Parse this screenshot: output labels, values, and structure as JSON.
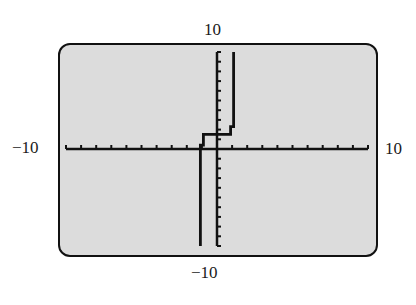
{
  "window": {
    "xmin": "−10",
    "xmax": "10",
    "ymin": "−10",
    "ymax": "10"
  },
  "chart_data": {
    "type": "line",
    "title": "",
    "xlabel": "",
    "ylabel": "",
    "xlim": [
      -10,
      10
    ],
    "ylim": [
      -10,
      10
    ],
    "xscale": 1,
    "yscale": 1,
    "grid": false,
    "legend": null,
    "tick_labels": {
      "x_left": "−10",
      "x_right": "10",
      "y_top": "10",
      "y_bottom": "−10"
    },
    "series": [
      {
        "name": "step curve",
        "description": "Piecewise step-like graph: vertical near x=-1 from y=-10 up to y~0.5, step right to x~-0.8, up to y~1.5, horizontal to x~1, up to y~2.5, then vertical near x=1 up to y=10",
        "points": [
          [
            -1.1,
            -10
          ],
          [
            -1.1,
            0.4
          ],
          [
            -0.9,
            0.4
          ],
          [
            -0.9,
            1.5
          ],
          [
            0.9,
            1.5
          ],
          [
            0.9,
            2.3
          ],
          [
            1.1,
            2.3
          ],
          [
            1.1,
            10
          ]
        ]
      }
    ],
    "colors": {
      "screen_bg": "#dcdcdc",
      "ink": "#111111"
    }
  }
}
